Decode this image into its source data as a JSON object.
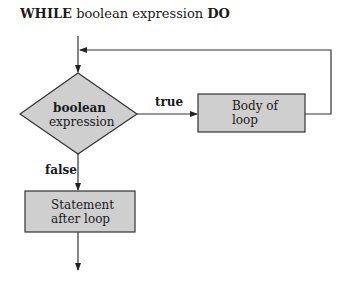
{
  "title": {
    "keyword_while": "WHILE",
    "middle": " boolean expression ",
    "keyword_do": "DO"
  },
  "nodes": {
    "condition": {
      "line1": "boolean",
      "line2": "expression"
    },
    "body": {
      "line1": "Body of",
      "line2": "loop"
    },
    "after": {
      "line1": "Statement",
      "line2": "after loop"
    }
  },
  "edges": {
    "true_label": "true",
    "false_label": "false"
  },
  "colors": {
    "shape_fill": "#cfcfcf",
    "stroke": "#333333"
  }
}
